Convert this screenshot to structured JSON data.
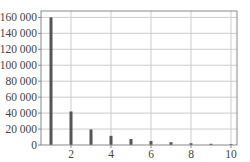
{
  "chart_data": {
    "type": "bar",
    "title": "",
    "xlabel": "",
    "ylabel": "",
    "x": [
      1,
      2,
      3,
      4,
      5,
      6,
      7,
      8,
      9,
      10
    ],
    "values": [
      160000,
      42000,
      19500,
      11500,
      7500,
      5000,
      3500,
      2200,
      1500,
      1000
    ],
    "xlim": [
      0.5,
      10.3
    ],
    "ylim": [
      0,
      168000
    ],
    "xticks": [
      2,
      4,
      6,
      8,
      10
    ],
    "xtick_labels": [
      "2",
      "4",
      "6",
      "8",
      "10"
    ],
    "yticks": [
      0,
      20000,
      40000,
      60000,
      80000,
      100000,
      120000,
      140000,
      160000
    ],
    "ytick_labels": [
      "0",
      "20 000",
      "40 000",
      "60 000",
      "80 000",
      "100 000",
      "120 000",
      "140 000",
      "160 000"
    ],
    "grid": true,
    "legend": null,
    "colors": {
      "bar": "#555555",
      "grid": "#cccccc",
      "frame": "#888888",
      "text": "#444444"
    }
  }
}
